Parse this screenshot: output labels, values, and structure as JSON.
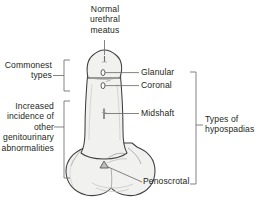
{
  "figure": {
    "background_color": "#ffffff",
    "line_color": "#3f3f3f",
    "organ_fill_color": "#f2f2f0",
    "text_color": "#231f20"
  },
  "labels": {
    "normal_meatus": "Normal\nurethral\nmeatus",
    "commonest_types": "Commonest\ntypes",
    "increased_incidence": "Increased\nincidence of\nother\ngenitourinary\nabnormalities",
    "glanular": "Glanular",
    "coronal": "Coronal",
    "midshaft": "Midshaft",
    "penoscrotal": "Penoscrotal",
    "types_of_hypospadias": "Types of\nhypospadias"
  },
  "markers": [
    {
      "name": "normal-urethral-meatus",
      "label": "Normal urethral meatus",
      "x": 105,
      "y": 59,
      "type": "tip-slit"
    },
    {
      "name": "glanular-meatus",
      "label": "Glanular",
      "x": 103,
      "y": 73,
      "type": "oval-opening"
    },
    {
      "name": "coronal-meatus",
      "label": "Coronal",
      "x": 103,
      "y": 86,
      "type": "oval-opening"
    },
    {
      "name": "midshaft-meatus",
      "label": "Midshaft",
      "x": 104,
      "y": 114,
      "type": "slit-opening"
    },
    {
      "name": "penoscrotal-meatus",
      "label": "Penoscrotal",
      "x": 104,
      "y": 165,
      "type": "arrow-opening"
    }
  ],
  "brackets": {
    "commonest_types": {
      "x": 64,
      "y_top": 60,
      "y_bottom": 91
    },
    "increased_incidence": {
      "x": 64,
      "y_top": 101,
      "y_bottom": 178
    },
    "types_of_hypospadias": {
      "x": 196,
      "y_top": 72,
      "y_bottom": 184
    }
  }
}
